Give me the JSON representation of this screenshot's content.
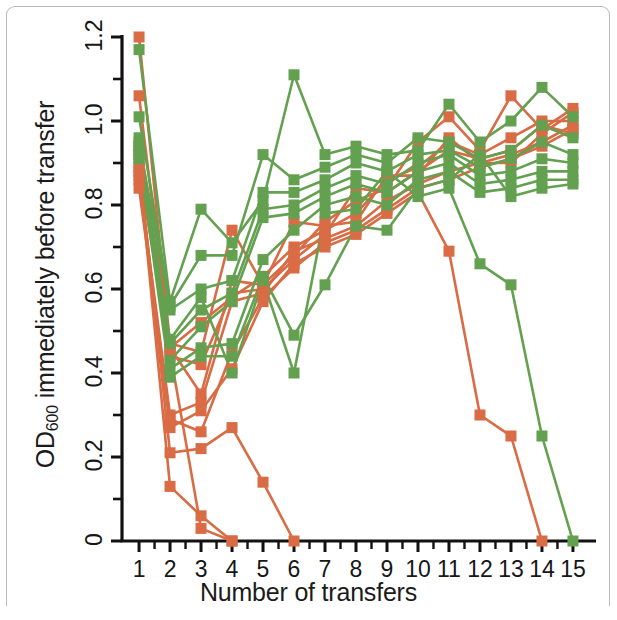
{
  "figure": {
    "frame": true,
    "background": "#ffffff"
  },
  "axis": {
    "x_title": "Number of transfers",
    "y_title_main": "OD",
    "y_title_sub": "600",
    "y_title_rest": " immediately before transfer",
    "y_title_full": "OD600 immediately before transfer"
  },
  "chart_data": {
    "type": "line",
    "title": "",
    "subtitle": "",
    "xlabel": "Number of transfers",
    "ylabel": "OD600 immediately before transfer",
    "xlim": [
      0.45,
      15.55
    ],
    "ylim": [
      0,
      1.2
    ],
    "xticks": [
      1,
      2,
      3,
      4,
      5,
      6,
      7,
      8,
      9,
      10,
      11,
      12,
      13,
      14,
      15
    ],
    "xtick_labels": [
      "1",
      "2",
      "3",
      "4",
      "5",
      "6",
      "7",
      "8",
      "9",
      "10",
      "11",
      "12",
      "13",
      "14",
      "15"
    ],
    "yticks": [
      0,
      0.2,
      0.4,
      0.6,
      0.8,
      1.0,
      1.2
    ],
    "ytick_labels": [
      "0",
      "0.2",
      "0.4",
      "0.6",
      "0.8",
      "1.0",
      "1.2"
    ],
    "yticks_minor": [
      0.1,
      0.3,
      0.5,
      0.7,
      0.9,
      1.1
    ],
    "grid": false,
    "legend": "none",
    "marker": "square",
    "marker_size": 11,
    "line_width": 2.6,
    "colors": {
      "orange": "#d96b45",
      "green": "#63a150",
      "axis": "#111111",
      "frame": "#b9b9b9"
    },
    "x": [
      1,
      2,
      3,
      4,
      5,
      6,
      7,
      8,
      9,
      10,
      11,
      12,
      13,
      14,
      15
    ],
    "series": [
      {
        "name": "orange-1",
        "color": "orange",
        "values": [
          1.2,
          0.47,
          0.45,
          0.74,
          0.61,
          0.68,
          0.76,
          0.81,
          0.84,
          0.95,
          1.01,
          0.93,
          1.06,
          0.98,
          1.03
        ]
      },
      {
        "name": "orange-2",
        "color": "orange",
        "values": [
          1.06,
          0.46,
          0.52,
          0.58,
          0.63,
          0.7,
          0.74,
          0.78,
          0.86,
          0.89,
          0.95,
          0.92,
          0.96,
          1.0,
          1.0
        ]
      },
      {
        "name": "orange-3",
        "color": "orange",
        "values": [
          0.94,
          0.44,
          0.42,
          0.59,
          0.6,
          0.67,
          0.73,
          0.84,
          0.83,
          0.88,
          0.93,
          0.91,
          0.93,
          0.99,
          0.97
        ]
      },
      {
        "name": "orange-4",
        "color": "orange",
        "values": [
          0.88,
          0.46,
          0.35,
          0.62,
          0.61,
          0.76,
          0.75,
          0.76,
          0.87,
          0.87,
          0.96,
          0.9,
          0.9,
          0.97,
          1.02
        ]
      },
      {
        "name": "orange-5",
        "color": "orange",
        "values": [
          0.86,
          0.3,
          0.33,
          0.57,
          0.59,
          0.69,
          0.72,
          0.75,
          0.81,
          0.85,
          0.88,
          0.9,
          0.92,
          0.95,
          0.99
        ]
      },
      {
        "name": "orange-6",
        "color": "orange",
        "values": [
          0.84,
          0.29,
          0.26,
          0.45,
          0.58,
          0.65,
          0.71,
          0.74,
          0.79,
          0.84,
          0.86,
          0.89,
          0.91,
          0.94,
          0.98
        ]
      },
      {
        "name": "orange-7",
        "color": "orange",
        "values": [
          0.87,
          0.27,
          0.31,
          0.41,
          0.57,
          0.66,
          0.7,
          0.73,
          0.78,
          0.83,
          0.69,
          0.3,
          0.25,
          0.0,
          null
        ]
      },
      {
        "name": "orange-8",
        "color": "orange",
        "values": [
          0.9,
          0.21,
          0.22,
          0.27,
          0.14,
          0.0,
          null,
          null,
          null,
          null,
          null,
          null,
          null,
          null,
          null
        ]
      },
      {
        "name": "orange-9",
        "color": "orange",
        "values": [
          0.89,
          0.13,
          0.06,
          0.0,
          null,
          null,
          null,
          null,
          null,
          null,
          null,
          null,
          null,
          null,
          null
        ]
      },
      {
        "name": "orange-10",
        "color": "orange",
        "values": [
          0.92,
          0.45,
          0.03,
          0.0,
          null,
          null,
          null,
          null,
          null,
          null,
          null,
          null,
          null,
          null,
          null
        ]
      },
      {
        "name": "green-1",
        "color": "green",
        "values": [
          1.17,
          0.57,
          0.79,
          0.71,
          0.81,
          1.11,
          0.92,
          0.94,
          0.92,
          0.93,
          1.04,
          0.95,
          1.0,
          1.08,
          1.01
        ]
      },
      {
        "name": "green-2",
        "color": "green",
        "values": [
          1.01,
          0.56,
          0.68,
          0.68,
          0.92,
          0.86,
          0.89,
          0.92,
          0.9,
          0.96,
          0.95,
          0.91,
          0.93,
          0.99,
          0.96
        ]
      },
      {
        "name": "green-3",
        "color": "green",
        "values": [
          0.95,
          0.55,
          0.6,
          0.62,
          0.83,
          0.83,
          0.86,
          0.9,
          0.88,
          0.92,
          0.93,
          0.89,
          0.91,
          0.95,
          0.92
        ]
      },
      {
        "name": "green-4",
        "color": "green",
        "values": [
          0.96,
          0.47,
          0.55,
          0.59,
          0.79,
          0.8,
          0.84,
          0.87,
          0.85,
          0.9,
          0.92,
          0.87,
          0.88,
          0.91,
          0.9
        ]
      },
      {
        "name": "green-5",
        "color": "green",
        "values": [
          0.94,
          0.43,
          0.51,
          0.57,
          0.77,
          0.78,
          0.82,
          0.85,
          0.83,
          0.88,
          0.9,
          0.85,
          0.86,
          0.88,
          0.88
        ]
      },
      {
        "name": "green-6",
        "color": "green",
        "values": [
          0.93,
          0.41,
          0.46,
          0.47,
          0.67,
          0.74,
          0.8,
          0.82,
          0.8,
          0.86,
          0.88,
          0.83,
          0.84,
          0.86,
          0.86
        ]
      },
      {
        "name": "green-7",
        "color": "green",
        "values": [
          0.92,
          0.39,
          0.44,
          0.44,
          0.63,
          0.49,
          0.61,
          0.75,
          0.74,
          0.84,
          0.86,
          0.92,
          0.82,
          0.84,
          0.85
        ]
      },
      {
        "name": "green-8",
        "color": "green",
        "values": [
          0.91,
          0.48,
          0.58,
          0.4,
          0.62,
          0.4,
          0.78,
          0.79,
          0.88,
          0.82,
          0.84,
          0.66,
          0.61,
          0.25,
          0.0
        ]
      }
    ]
  }
}
